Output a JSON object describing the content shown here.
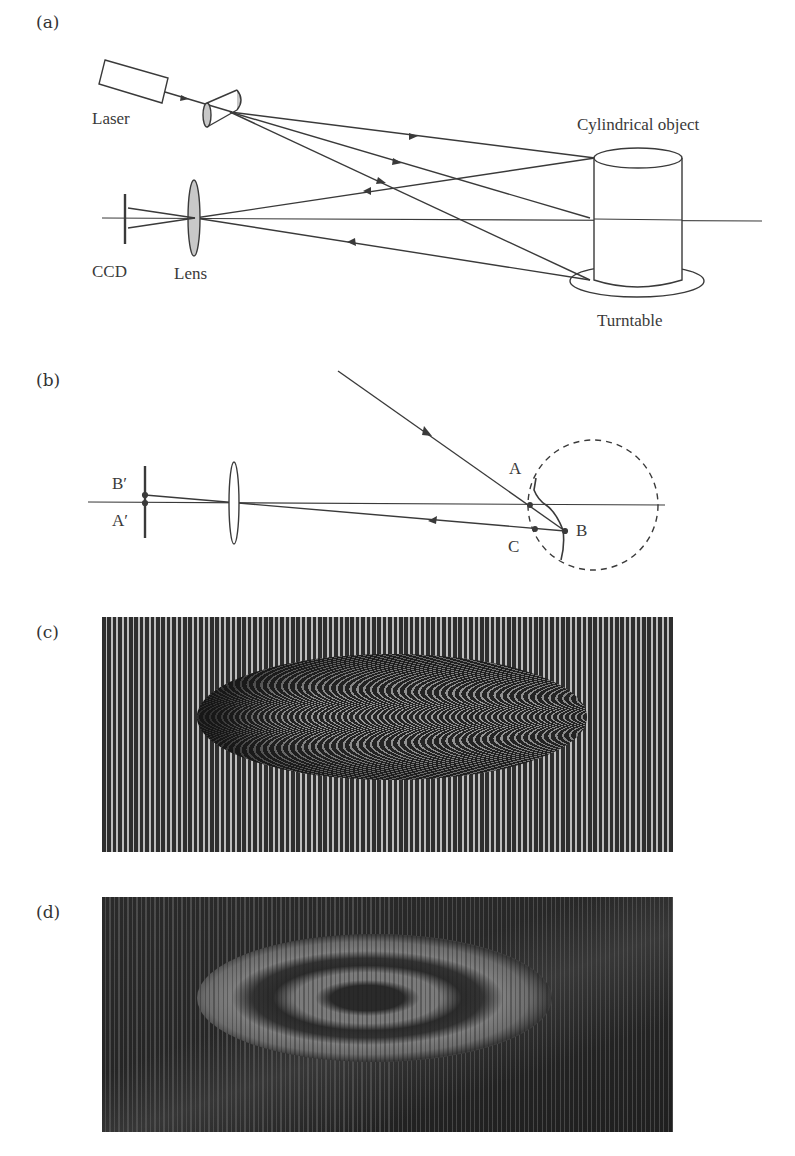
{
  "figure": {
    "panels": [
      {
        "id": "a",
        "label": "(a)",
        "components": {
          "laser": "Laser",
          "object": "Cylindrical object",
          "turntable": "Turntable",
          "camera": "CCD",
          "lens": "Lens"
        }
      },
      {
        "id": "b",
        "label": "(b)",
        "points": {
          "a": "A",
          "b": "B",
          "c": "C",
          "b_prime": "B′",
          "a_prime": "A′"
        }
      },
      {
        "id": "c",
        "label": "(c)",
        "content": "Deformed vertical fringe pattern with elliptical curved fringe region"
      },
      {
        "id": "d",
        "label": "(d)",
        "content": "Moiré contour pattern showing concentric elliptical fringes"
      }
    ]
  },
  "colors": {
    "line": "#3a3a3a",
    "lens_fill": "#c8c8c8",
    "fringe_dark": "#2e2e2e",
    "fringe_light": "#bdbdbd"
  }
}
